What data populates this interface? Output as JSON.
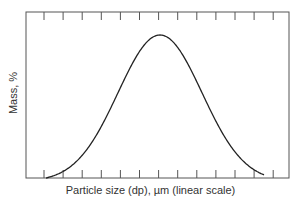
{
  "chart_data": {
    "type": "line",
    "title": "",
    "xlabel": "Particle size (dp), µm (linear scale)",
    "ylabel": "Mass, %",
    "x_ticks_count": 13,
    "tick_labels": [],
    "grid": false,
    "legend": null,
    "series": [
      {
        "name": "mass distribution",
        "description": "Bell-shaped (normal) distribution curve, peaking near the middle of the x range",
        "x": [
          0.1,
          1,
          2,
          3,
          4,
          5,
          6,
          7,
          8,
          9,
          10,
          11,
          11.5
        ],
        "values": [
          0,
          3,
          15,
          38,
          68,
          92,
          100,
          92,
          68,
          38,
          15,
          3,
          0
        ]
      }
    ],
    "xlim": [
      0,
      13
    ],
    "ylim": [
      0,
      110
    ]
  },
  "labels": {
    "xlabel": "Particle size (dp), µm (linear scale)",
    "ylabel": "Mass, %"
  }
}
